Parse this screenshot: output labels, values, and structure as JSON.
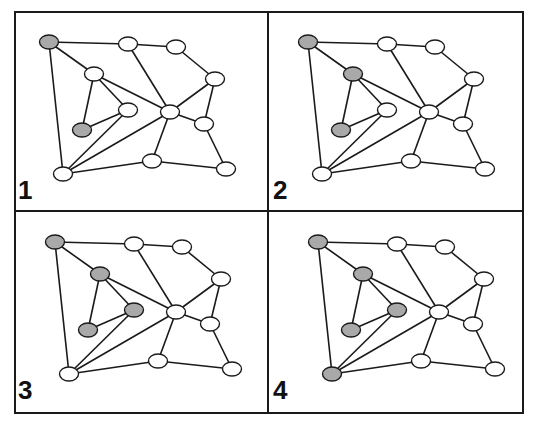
{
  "figure": {
    "colors": {
      "shaded_node": "#a9a9a9",
      "empty_node": "#ffffff",
      "edge": "#1a1a1a",
      "border": "#1a1a1a"
    },
    "nodes": [
      {
        "id": "A",
        "x": 0,
        "y": 0
      },
      {
        "id": "B",
        "x": 79,
        "y": 2
      },
      {
        "id": "C",
        "x": 127,
        "y": 5
      },
      {
        "id": "D",
        "x": 166,
        "y": 37
      },
      {
        "id": "E",
        "x": 45,
        "y": 32
      },
      {
        "id": "F",
        "x": 79,
        "y": 68
      },
      {
        "id": "G",
        "x": 33,
        "y": 88
      },
      {
        "id": "H",
        "x": 121,
        "y": 70
      },
      {
        "id": "I",
        "x": 155,
        "y": 82
      },
      {
        "id": "J",
        "x": 14,
        "y": 132
      },
      {
        "id": "K",
        "x": 103,
        "y": 119
      },
      {
        "id": "L",
        "x": 177,
        "y": 127
      }
    ],
    "edges": [
      [
        "A",
        "B"
      ],
      [
        "B",
        "C"
      ],
      [
        "C",
        "D"
      ],
      [
        "A",
        "E"
      ],
      [
        "A",
        "J"
      ],
      [
        "E",
        "G"
      ],
      [
        "E",
        "F"
      ],
      [
        "E",
        "H"
      ],
      [
        "G",
        "F"
      ],
      [
        "F",
        "J"
      ],
      [
        "J",
        "H"
      ],
      [
        "J",
        "K"
      ],
      [
        "B",
        "H"
      ],
      [
        "H",
        "D"
      ],
      [
        "D",
        "I"
      ],
      [
        "H",
        "I"
      ],
      [
        "H",
        "K"
      ],
      [
        "K",
        "L"
      ],
      [
        "I",
        "L"
      ]
    ],
    "panels": [
      {
        "label": "1",
        "origin": [
          49,
          42
        ],
        "label_pos": [
          18,
          177
        ],
        "shaded": [
          "A",
          "G"
        ]
      },
      {
        "label": "2",
        "origin": [
          308,
          42
        ],
        "label_pos": [
          273,
          177
        ],
        "shaded": [
          "A",
          "G",
          "E"
        ]
      },
      {
        "label": "3",
        "origin": [
          55,
          242
        ],
        "label_pos": [
          18,
          377
        ],
        "shaded": [
          "A",
          "G",
          "E",
          "F"
        ]
      },
      {
        "label": "4",
        "origin": [
          318,
          242
        ],
        "label_pos": [
          273,
          377
        ],
        "shaded": [
          "A",
          "G",
          "E",
          "F",
          "J"
        ]
      }
    ]
  }
}
